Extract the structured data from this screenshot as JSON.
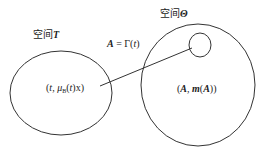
{
  "diagram": {
    "space_t_label": {
      "prefix": "空间",
      "symbol": "T"
    },
    "space_theta_label": {
      "prefix": "空间",
      "symbol": "Θ"
    },
    "mapping_label": {
      "lhs": "A",
      "eq": " = Γ(",
      "var": "t",
      "close": ")"
    },
    "left_set_element": {
      "open": "(",
      "t": "t",
      "sep": ", μ",
      "sub": "B",
      "rest_open": "(",
      "t2": "t",
      "rest_close": ")x)"
    },
    "right_set_element": {
      "open": "(",
      "A": "A",
      "sep": ", ",
      "m": "m",
      "paren_open": "(",
      "A2": "A",
      "close": "))"
    },
    "nodes": [
      {
        "id": "space-T",
        "shape": "ellipse",
        "cx": 61,
        "cy": 93,
        "rx": 51,
        "ry": 42
      },
      {
        "id": "space-Theta",
        "shape": "ellipse",
        "cx": 198,
        "cy": 85,
        "rx": 57,
        "ry": 61
      },
      {
        "id": "subset-A",
        "shape": "ellipse",
        "cx": 200,
        "cy": 45,
        "rx": 11,
        "ry": 12
      }
    ],
    "edges": [
      {
        "from": "space-T",
        "to": "subset-A",
        "x1": 100,
        "y1": 86,
        "x2": 192,
        "y2": 48
      }
    ],
    "stroke_color": "#333333"
  }
}
